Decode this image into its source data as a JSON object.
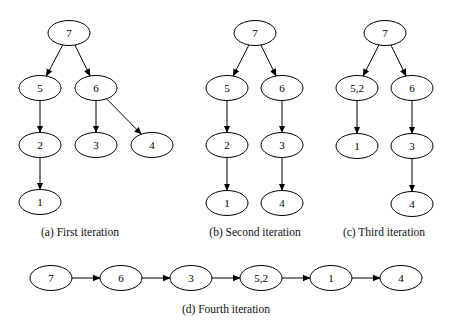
{
  "panels": [
    {
      "id": "a",
      "caption": "(a) First iteration",
      "caption_pos": [
        80,
        236
      ],
      "nodes": [
        {
          "id": "a7",
          "label": "7",
          "x": 69,
          "y": 33
        },
        {
          "id": "a5",
          "label": "5",
          "x": 40,
          "y": 88
        },
        {
          "id": "a6",
          "label": "6",
          "x": 96,
          "y": 88
        },
        {
          "id": "a2",
          "label": "2",
          "x": 40,
          "y": 145
        },
        {
          "id": "a3",
          "label": "3",
          "x": 96,
          "y": 145
        },
        {
          "id": "a4",
          "label": "4",
          "x": 152,
          "y": 145
        },
        {
          "id": "a1",
          "label": "1",
          "x": 40,
          "y": 202
        }
      ],
      "edges": [
        [
          "a7",
          "a5"
        ],
        [
          "a7",
          "a6"
        ],
        [
          "a5",
          "a2"
        ],
        [
          "a2",
          "a1"
        ],
        [
          "a6",
          "a3"
        ],
        [
          "a6",
          "a4"
        ]
      ]
    },
    {
      "id": "b",
      "caption": "(b) Second iteration",
      "caption_pos": [
        255,
        236
      ],
      "nodes": [
        {
          "id": "b7",
          "label": "7",
          "x": 255,
          "y": 33
        },
        {
          "id": "b5",
          "label": "5",
          "x": 227,
          "y": 88
        },
        {
          "id": "b6",
          "label": "6",
          "x": 282,
          "y": 88
        },
        {
          "id": "b2",
          "label": "2",
          "x": 227,
          "y": 145
        },
        {
          "id": "b3",
          "label": "3",
          "x": 282,
          "y": 145
        },
        {
          "id": "b1",
          "label": "1",
          "x": 227,
          "y": 203
        },
        {
          "id": "b4",
          "label": "4",
          "x": 282,
          "y": 203
        }
      ],
      "edges": [
        [
          "b7",
          "b5"
        ],
        [
          "b7",
          "b6"
        ],
        [
          "b5",
          "b2"
        ],
        [
          "b2",
          "b1"
        ],
        [
          "b6",
          "b3"
        ],
        [
          "b3",
          "b4"
        ]
      ]
    },
    {
      "id": "c",
      "caption": "(c) Third iteration",
      "caption_pos": [
        384,
        236
      ],
      "nodes": [
        {
          "id": "c7",
          "label": "7",
          "x": 385,
          "y": 33
        },
        {
          "id": "c52",
          "label": "5,2",
          "x": 357,
          "y": 88
        },
        {
          "id": "c6",
          "label": "6",
          "x": 412,
          "y": 88
        },
        {
          "id": "c1",
          "label": "1",
          "x": 357,
          "y": 146
        },
        {
          "id": "c3",
          "label": "3",
          "x": 412,
          "y": 146
        },
        {
          "id": "c4",
          "label": "4",
          "x": 412,
          "y": 204
        }
      ],
      "edges": [
        [
          "c7",
          "c52"
        ],
        [
          "c7",
          "c6"
        ],
        [
          "c52",
          "c1"
        ],
        [
          "c6",
          "c3"
        ],
        [
          "c3",
          "c4"
        ]
      ]
    },
    {
      "id": "d",
      "caption": "(d) Fourth iteration",
      "caption_pos": [
        226,
        313
      ],
      "nodes": [
        {
          "id": "d7",
          "label": "7",
          "x": 51,
          "y": 278
        },
        {
          "id": "d6",
          "label": "6",
          "x": 121,
          "y": 278
        },
        {
          "id": "d3",
          "label": "3",
          "x": 191,
          "y": 278
        },
        {
          "id": "d52",
          "label": "5,2",
          "x": 261,
          "y": 278
        },
        {
          "id": "d1",
          "label": "1",
          "x": 331,
          "y": 278
        },
        {
          "id": "d4",
          "label": "4",
          "x": 401,
          "y": 278
        }
      ],
      "edges": [
        [
          "d7",
          "d6"
        ],
        [
          "d6",
          "d3"
        ],
        [
          "d3",
          "d52"
        ],
        [
          "d52",
          "d1"
        ],
        [
          "d1",
          "d4"
        ]
      ]
    }
  ],
  "node_shape": {
    "rx": 21,
    "ry": 12.5
  },
  "colors": {
    "stroke": "#000000",
    "fill": "#ffffff",
    "background": "#ffffff"
  }
}
